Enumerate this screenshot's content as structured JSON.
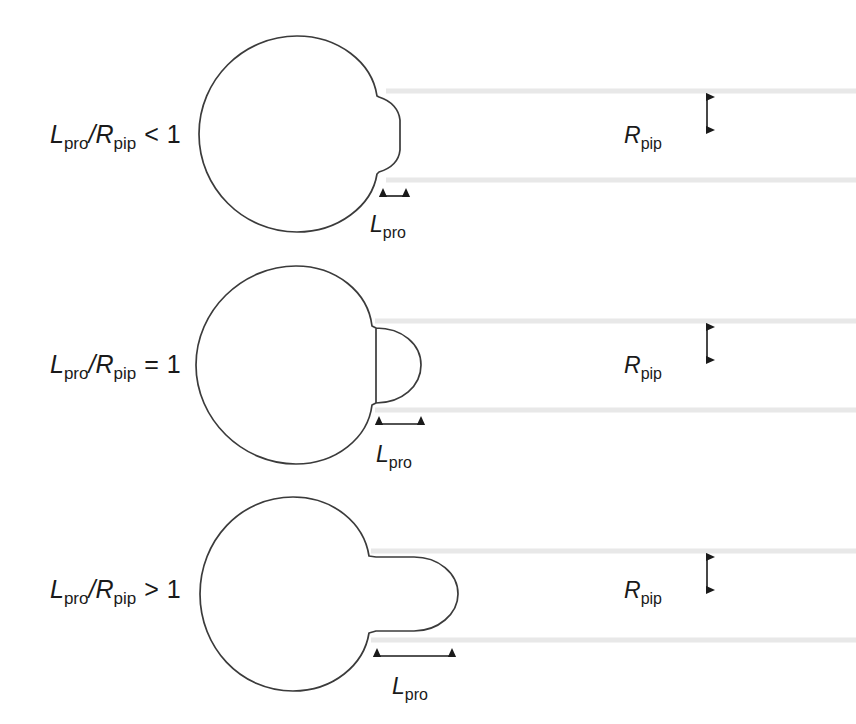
{
  "figure": {
    "width": 856,
    "height": 724,
    "background_color": "#ffffff"
  },
  "style": {
    "outline_color": "#3b3b3b",
    "pipette_wall_color": "#e8e8e8",
    "text_color": "#1a1a1a",
    "arrow_color": "#1a1a1a"
  },
  "symbols": {
    "L": "L",
    "L_sub": "pro",
    "R": "R",
    "R_sub": "pip",
    "divider": "/"
  },
  "panels": [
    {
      "id": "panel-less-than",
      "condition_operator": "<",
      "condition_value": "1",
      "condition_full": "Lpro/Rpip < 1",
      "regime": "shallow-bulge",
      "label_L": "L",
      "label_L_sub": "pro",
      "label_divider": "/",
      "label_R": "R",
      "label_R_sub": "pip",
      "length_label": "L",
      "length_label_sub": "pro",
      "radius_label": "R",
      "radius_label_sub": "pip",
      "pipette_top_y": 91,
      "pipette_bottom_y": 180,
      "pipette_radius_px": 44,
      "protrusion_length_px": 25
    },
    {
      "id": "panel-equal",
      "condition_operator": "=",
      "condition_value": "1",
      "condition_full": "Lpro/Rpip = 1",
      "regime": "hemisphere",
      "label_L": "L",
      "label_L_sub": "pro",
      "label_divider": "/",
      "label_R": "R",
      "label_R_sub": "pip",
      "length_label": "L",
      "length_label_sub": "pro",
      "radius_label": "R",
      "radius_label_sub": "pip",
      "pipette_top_y": 321,
      "pipette_bottom_y": 410,
      "pipette_radius_px": 44,
      "protrusion_length_px": 44
    },
    {
      "id": "panel-greater-than",
      "condition_operator": ">",
      "condition_value": "1",
      "condition_full": "Lpro/Rpip > 1",
      "regime": "elongated-tongue",
      "label_L": "L",
      "label_L_sub": "pro",
      "label_divider": "/",
      "label_R": "R",
      "label_R_sub": "pip",
      "length_label": "L",
      "length_label_sub": "pro",
      "radius_label": "R",
      "radius_label_sub": "pip",
      "pipette_top_y": 551,
      "pipette_bottom_y": 640,
      "pipette_radius_px": 44,
      "protrusion_length_px": 78
    }
  ]
}
